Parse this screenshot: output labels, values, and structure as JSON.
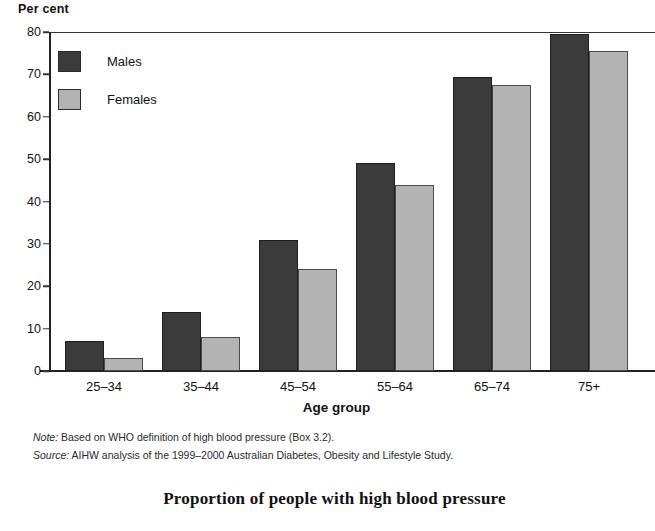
{
  "chart_data": {
    "type": "bar",
    "title": "Proportion of people with high blood pressure",
    "xlabel": "Age group",
    "ylabel": "Per cent",
    "ylim": [
      0,
      80
    ],
    "yticks": [
      0,
      10,
      20,
      30,
      40,
      50,
      60,
      70,
      80
    ],
    "grid": false,
    "legend_position": "top-left",
    "categories": [
      "25–34",
      "35–44",
      "45–54",
      "55–64",
      "65–74",
      "75+"
    ],
    "series": [
      {
        "name": "Males",
        "color": "#3b3b3b",
        "values": [
          7,
          14,
          31,
          49,
          69.5,
          79.5
        ]
      },
      {
        "name": "Females",
        "color": "#b3b3b3",
        "values": [
          3,
          8,
          24,
          44,
          67.5,
          75.5
        ]
      }
    ]
  },
  "notes": [
    {
      "key": "Note:",
      "text": " Based on WHO definition of high blood pressure (Box 3.2)."
    },
    {
      "key": "Source:",
      "text": " AIHW analysis of the 1999–2000 Australian Diabetes, Obesity and Lifestyle Study."
    }
  ]
}
